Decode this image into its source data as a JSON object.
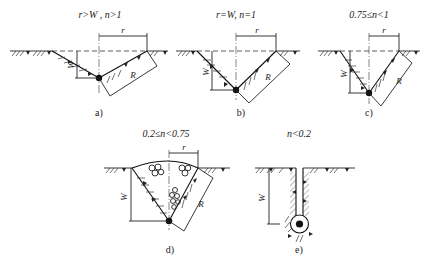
{
  "figure": {
    "panels": [
      {
        "id": "a",
        "condition": "r>W , n>1",
        "caption": "a)",
        "symbols": {
          "radius": "r",
          "depth": "W",
          "rupture": "R"
        }
      },
      {
        "id": "b",
        "condition": "r=W, n=1",
        "caption": "b)",
        "symbols": {
          "radius": "r",
          "depth": "W",
          "rupture": "R"
        }
      },
      {
        "id": "c",
        "condition": "0.75≤n<1",
        "caption": "c)",
        "symbols": {
          "radius": "r",
          "depth": "W",
          "rupture": "R"
        }
      },
      {
        "id": "d",
        "condition": "0.2≤n<0.75",
        "caption": "d)",
        "symbols": {
          "radius": "r",
          "depth": "W",
          "rupture": "R"
        }
      },
      {
        "id": "e",
        "condition": "n<0.2",
        "caption": "e)",
        "symbols": {
          "depth": "W"
        }
      }
    ]
  }
}
